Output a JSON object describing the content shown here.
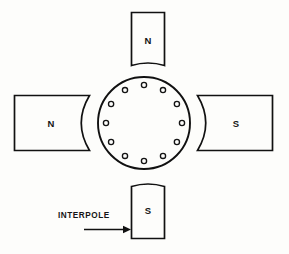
{
  "diagram": {
    "background_color": "#fdfdfb",
    "line_color": "#111111",
    "main_poles": [
      {
        "id": "left-main-pole",
        "label": "N",
        "position": "left"
      },
      {
        "id": "right-main-pole",
        "label": "S",
        "position": "right"
      }
    ],
    "interpoles": [
      {
        "id": "top-interpole",
        "label": "N",
        "position": "top"
      },
      {
        "id": "bottom-interpole",
        "label": "S",
        "position": "bottom"
      }
    ],
    "armature": {
      "id": "armature",
      "conductor_count": 12,
      "center_x": 144,
      "center_y": 123,
      "outer_radius": 46,
      "conductor_radius": 38,
      "conductor_size": 5.2
    },
    "annotation": {
      "label": "INTERPOLE",
      "arrow": "right-arrow",
      "points_to": "bottom-interpole"
    }
  }
}
